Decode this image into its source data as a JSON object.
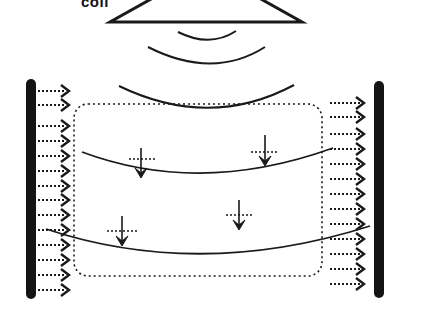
{
  "diagram": {
    "coil_label": "coil",
    "colors": {
      "ink": "#1a1a1a",
      "bar": "#141414",
      "background": "#ffffff"
    },
    "coil": {
      "base_left": 110,
      "base_right": 302,
      "base_y": 22,
      "apex_left_x": 160,
      "apex_right_x": 252
    },
    "wavefronts": [
      {
        "x1": 178,
        "y1": 32,
        "cx": 210,
        "cy": 48,
        "x2": 236,
        "y2": 31
      },
      {
        "x1": 148,
        "y1": 47,
        "cx": 213,
        "cy": 80,
        "x2": 265,
        "y2": 47
      },
      {
        "x1": 119,
        "y1": 86,
        "cx": 210,
        "cy": 130,
        "x2": 294,
        "y2": 85
      }
    ],
    "region_box": {
      "x": 74,
      "y": 104,
      "w": 248,
      "h": 172,
      "r": 14
    },
    "field_lines": [
      {
        "x1": 82,
        "y1": 152,
        "cx": 200,
        "cy": 196,
        "x2": 333,
        "y2": 148
      },
      {
        "x1": 46,
        "y1": 229,
        "cx": 200,
        "cy": 280,
        "x2": 370,
        "y2": 226
      }
    ],
    "left_bar": {
      "x": 31,
      "y1": 84,
      "y2": 294,
      "w": 10
    },
    "right_bar": {
      "x": 379,
      "y1": 86,
      "y2": 293,
      "w": 10
    },
    "left_arrows_y": [
      91,
      105,
      126,
      141,
      156,
      171,
      186,
      200,
      215,
      230,
      245,
      260,
      275,
      290
    ],
    "right_arrows_y": [
      103,
      117,
      134,
      149,
      164,
      179,
      194,
      209,
      224,
      239,
      254,
      269,
      284
    ],
    "spin_arrows": [
      {
        "x": 141,
        "y_top": 148,
        "y_tip": 178,
        "hline_x1": 129,
        "hline_x2": 157,
        "hline_y": 159
      },
      {
        "x": 265,
        "y_top": 135,
        "y_tip": 166,
        "hline_x1": 251,
        "hline_x2": 279,
        "hline_y": 152
      },
      {
        "x": 122,
        "y_top": 216,
        "y_tip": 246,
        "hline_x1": 107,
        "hline_x2": 138,
        "hline_y": 231
      },
      {
        "x": 239,
        "y_top": 200,
        "y_tip": 230,
        "hline_x1": 226,
        "hline_x2": 254,
        "hline_y": 215
      }
    ]
  }
}
